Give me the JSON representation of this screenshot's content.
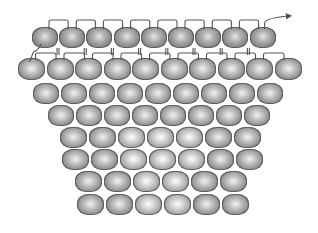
{
  "diagram": {
    "title": "Bead weaving pattern diagram (tapered shape with thread path)",
    "thread_color": "#555555",
    "rows": [
      {
        "count": 9,
        "x0": 32,
        "y": 27,
        "w": 26,
        "h": 21,
        "gap": 1.2,
        "style": "top"
      },
      {
        "count": 10,
        "x0": 18,
        "y": 58,
        "w": 27,
        "h": 22,
        "gap": 1.5,
        "style": "normal"
      },
      {
        "count": 9,
        "x0": 33,
        "y": 83,
        "w": 26,
        "h": 21,
        "gap": 2,
        "style": "normal"
      },
      {
        "count": 8,
        "x0": 48,
        "y": 105,
        "w": 26,
        "h": 21,
        "gap": 2,
        "style": "normal"
      },
      {
        "count": 7,
        "x0": 60,
        "y": 127,
        "w": 27,
        "h": 21,
        "gap": 2,
        "style": "normal"
      },
      {
        "count": 7,
        "x0": 62,
        "y": 149,
        "w": 27,
        "h": 21,
        "gap": 2,
        "style": "normal"
      },
      {
        "count": 6,
        "x0": 75,
        "y": 171,
        "w": 27,
        "h": 21,
        "gap": 2,
        "style": "normal"
      },
      {
        "count": 6,
        "x0": 77,
        "y": 194,
        "w": 27,
        "h": 21,
        "gap": 2,
        "style": "normal"
      }
    ],
    "arrow": {
      "x": 289,
      "y": 16,
      "label": "thread-exit-arrow"
    }
  }
}
